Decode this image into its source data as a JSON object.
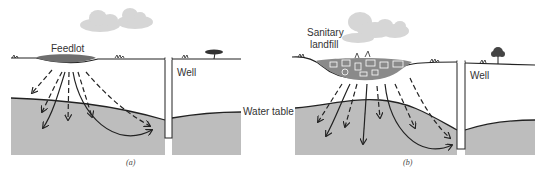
{
  "figure": {
    "panel_a": {
      "source_label": "Feedlot",
      "well_label": "Well",
      "water_table_label": "Water table",
      "caption": "(a)"
    },
    "panel_b": {
      "source_label_line1": "Sanitary",
      "source_label_line2": "landfill",
      "well_label": "Well",
      "caption": "(b)"
    },
    "colors": {
      "groundwater": "#bdbdbd",
      "feedlot": "#6e6e6e",
      "landfill": "#8a8a8a",
      "cloud": "#d6d6d6",
      "line": "#222222"
    }
  }
}
